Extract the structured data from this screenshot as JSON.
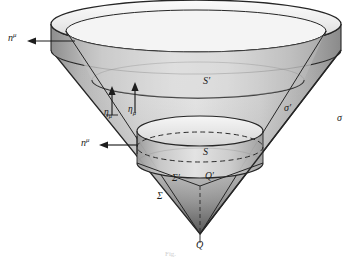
{
  "figure": {
    "caption": "Fig.",
    "background_color": "#ffffff",
    "line_color": "#262626",
    "shade_light": "#f0f0f0",
    "shade_mid": "#d2d2d2",
    "shade_dark": "#8a8a8a",
    "shade_darkest": "#4a4a4a"
  },
  "labels": {
    "normal_top": {
      "base": "n",
      "script": "μ",
      "kind": "superscript",
      "text": "nμ"
    },
    "normal_mid": {
      "base": "n",
      "script": "μ",
      "kind": "superscript",
      "text": "nμ"
    },
    "eta_left": {
      "base": "η",
      "script": "μ",
      "kind": "subscript",
      "text": "ημ"
    },
    "eta_right": {
      "base": "η",
      "script": "μ",
      "kind": "subscript",
      "text": "ημ"
    },
    "surface_s_prime": {
      "text": "S′"
    },
    "surface_s": {
      "text": "S"
    },
    "sigma_prime": {
      "text": "σ′"
    },
    "sigma": {
      "text": "σ"
    },
    "bigsigma_prime": {
      "text": "Σ′"
    },
    "bigsigma": {
      "text": "Σ"
    },
    "point_q_prime": {
      "text": "Q′"
    },
    "point_q": {
      "text": "Q"
    }
  },
  "geometry": {
    "apex": {
      "x": 200,
      "y": 234
    },
    "outer_rim_top": {
      "cx": 196,
      "cy": 24,
      "rx": 145,
      "ry": 24
    },
    "outer_rim_bottom": {
      "cx": 196,
      "cy": 50,
      "rx": 145,
      "ry": 24
    },
    "inner_rim_top": {
      "cx": 196,
      "cy": 31,
      "rx": 130,
      "ry": 21
    },
    "inner_rim_bottom": {
      "cx": 196,
      "cy": 57,
      "rx": 130,
      "ry": 21
    },
    "s_prime_ring": {
      "cx": 198,
      "cy": 80,
      "rx": 106,
      "ry": 18
    },
    "small_cone_top": {
      "cx": 200,
      "cy": 131,
      "rx": 63,
      "ry": 15
    },
    "small_cone_mid": {
      "cx": 200,
      "cy": 147,
      "rx": 63,
      "ry": 15
    },
    "small_cone_bottom": {
      "cx": 200,
      "cy": 163,
      "rx": 63,
      "ry": 15
    },
    "q_prime": {
      "x": 200,
      "y": 186
    }
  }
}
